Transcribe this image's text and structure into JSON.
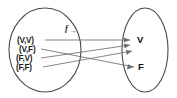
{
  "diagram": {
    "type": "function-mapping-diagram",
    "background_color": "#ffffff",
    "stroke_color": "#4a4a4a",
    "arrow_color": "#6e6e74",
    "text_color": "#1b1b1b",
    "function_label": {
      "symbol": "f",
      "subscript": "→",
      "name": "function-label"
    },
    "domain": {
      "name": "domain-set",
      "shape": "ellipse",
      "items": [
        {
          "label": "(V,V)",
          "name": "domain-item-vv"
        },
        {
          "label": "(V,F)",
          "name": "domain-item-vf"
        },
        {
          "label": "(F,V)",
          "name": "domain-item-fv"
        },
        {
          "label": "(F,F)",
          "name": "domain-item-ff"
        }
      ]
    },
    "codomain": {
      "name": "codomain-set",
      "shape": "ellipse",
      "items": [
        {
          "label": "V",
          "name": "codomain-item-v"
        },
        {
          "label": "F",
          "name": "codomain-item-f"
        }
      ]
    },
    "mappings": [
      {
        "from": "(V,V)",
        "to": "V",
        "name": "arrow-vv-to-v"
      },
      {
        "from": "(V,F)",
        "to": "F",
        "name": "arrow-vf-to-f"
      },
      {
        "from": "(F,V)",
        "to": "V",
        "name": "arrow-fv-to-v"
      },
      {
        "from": "(F,F)",
        "to": "V",
        "name": "arrow-ff-to-v"
      }
    ]
  }
}
